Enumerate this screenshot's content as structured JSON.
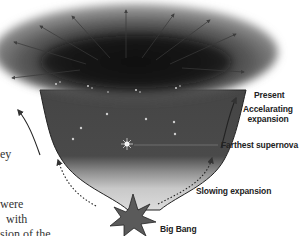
{
  "diagram": {
    "labels": {
      "present": "Present",
      "accelerating_line1": "Accelarating",
      "accelerating_line2": "expansion",
      "farthest_supernova": "Farthest supernova",
      "slowing": "Slowing expansion",
      "big_bang": "Big Bang"
    },
    "colors": {
      "cloud_dark": "#1c1c1c",
      "cloud_mid": "#5a5a5a",
      "funnel_light": "#d8d8d8",
      "star_burst": "#555555",
      "text": "#222222"
    }
  },
  "body_text_fragments": {
    "line1": "ey",
    "line2": "were",
    "line3": "with",
    "line4": "sion of the"
  }
}
